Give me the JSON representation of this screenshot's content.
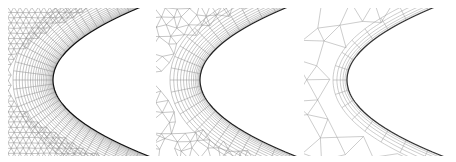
{
  "figure": {
    "panels": [
      {
        "id": "panel-fine-mesh",
        "description": "fine hybrid mesh around airfoil leading edge",
        "leading_edge": {
          "x": 45,
          "y": 72
        },
        "boundary_layers": 22,
        "normal_lines": 40,
        "far_spacing": 6,
        "line_color": "#8a8a8a",
        "wall_color": "#111111"
      },
      {
        "id": "panel-medium-mesh",
        "description": "medium hybrid mesh around airfoil leading edge",
        "leading_edge": {
          "x": 44,
          "y": 72
        },
        "boundary_layers": 14,
        "normal_lines": 26,
        "far_spacing": 11,
        "line_color": "#8f8f8f",
        "wall_color": "#222222"
      },
      {
        "id": "panel-coarse-mesh",
        "description": "coarse hybrid mesh around airfoil leading edge",
        "leading_edge": {
          "x": 43,
          "y": 72
        },
        "boundary_layers": 6,
        "normal_lines": 16,
        "far_spacing": 22,
        "line_color": "#9a9a9a",
        "wall_color": "#333333"
      }
    ]
  }
}
